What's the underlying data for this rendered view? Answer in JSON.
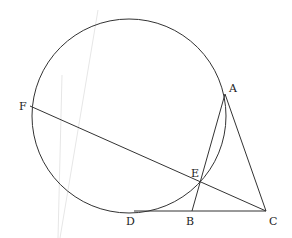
{
  "diagram": {
    "type": "geometry",
    "circle": {
      "cx": 129,
      "cy": 116,
      "r": 97
    },
    "points": {
      "A": {
        "x": 225,
        "y": 94
      },
      "B": {
        "x": 192,
        "y": 211
      },
      "C": {
        "x": 266,
        "y": 211
      },
      "D": {
        "x": 134,
        "y": 211
      },
      "E": {
        "x": 200,
        "y": 182
      },
      "F": {
        "x": 30,
        "y": 106
      }
    },
    "labels": {
      "A": "A",
      "B": "B",
      "C": "C",
      "D": "D",
      "E": "E",
      "F": "F"
    },
    "segments": [
      "FC",
      "AB",
      "AC",
      "DC"
    ]
  }
}
